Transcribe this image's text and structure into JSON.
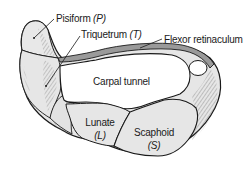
{
  "diagram": {
    "labels": {
      "pisiform": {
        "name": "Pisiform",
        "abbr": "(P)"
      },
      "triquetrum": {
        "name": "Triquetrum",
        "abbr": "(T)"
      },
      "flexor_retinaculum": {
        "name": "Flexor retinaculum"
      },
      "carpal_tunnel": {
        "name": "Carpal tunnel"
      },
      "lunate": {
        "name": "Lunate",
        "abbr": "(L)"
      },
      "scaphoid": {
        "name": "Scaphoid",
        "abbr": "(S)"
      }
    },
    "colors": {
      "outline": "#1a1a1a",
      "bone_fill": "#e6e6e6",
      "hatch": "#5a5a5a",
      "tunnel_fill": "#ffffff",
      "background": "#ffffff"
    }
  }
}
